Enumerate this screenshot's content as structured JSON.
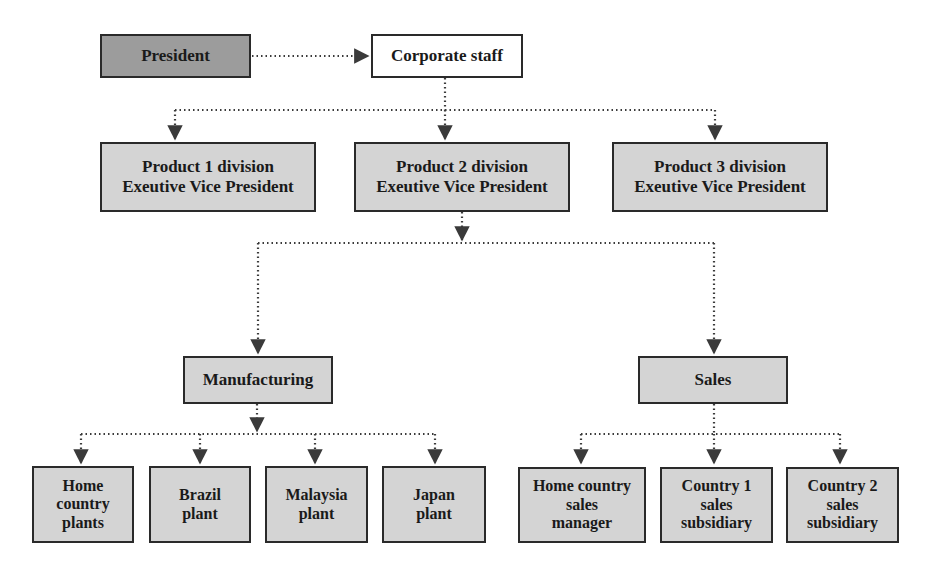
{
  "diagram": {
    "title_fragment": "",
    "colors": {
      "executive_fill": "#9c9c9c",
      "staff_fill": "#ffffff",
      "unit_fill": "#d4d4d4",
      "border": "#2a2a2a",
      "connector": "#3a3a3a"
    },
    "top": {
      "president": {
        "label": "President"
      },
      "corporate_staff": {
        "label": "Corporate staff"
      }
    },
    "divisions": [
      {
        "line1": "Product 1 division",
        "line2": "Exeutive Vice President"
      },
      {
        "line1": "Product 2 division",
        "line2": "Exeutive Vice President"
      },
      {
        "line1": "Product 3 division",
        "line2": "Exeutive Vice President"
      }
    ],
    "functions": {
      "manufacturing": {
        "label": "Manufacturing"
      },
      "sales": {
        "label": "Sales"
      }
    },
    "plants": [
      {
        "lines": [
          "Home",
          "country",
          "plants"
        ]
      },
      {
        "lines": [
          "Brazil",
          "plant"
        ]
      },
      {
        "lines": [
          "Malaysia",
          "plant"
        ]
      },
      {
        "lines": [
          "Japan",
          "plant"
        ]
      }
    ],
    "sales_units": [
      {
        "lines": [
          "Home country",
          "sales",
          "manager"
        ]
      },
      {
        "lines": [
          "Country 1",
          "sales",
          "subsidiary"
        ]
      },
      {
        "lines": [
          "Country 2",
          "sales",
          "subsidiary"
        ]
      }
    ],
    "connector_style": "dotted-arrow"
  }
}
